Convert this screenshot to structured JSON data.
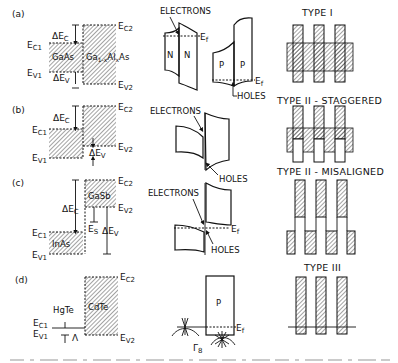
{
  "figure": {
    "panels": [
      {
        "id": "a",
        "label": "(a)",
        "left_material": "GaAs",
        "right_material": "Ga1-xAlxAs",
        "right_material_parts": [
          "Ga",
          "1-x",
          "Al",
          "x",
          "As"
        ],
        "energy_labels": {
          "ec1": "E",
          "ec1_sub": "C1",
          "ev1": "E",
          "ev1_sub": "V1",
          "ec2": "E",
          "ec2_sub": "C2",
          "ev2": "E",
          "ev2_sub": "V2"
        },
        "offsets": {
          "dec": "ΔE",
          "dec_sub": "C",
          "dev": "ΔE",
          "dev_sub": "V"
        },
        "band_diagram": {
          "n_label_left": "N",
          "n_label_right": "N",
          "p_label_left": "P",
          "p_label_right": "P",
          "electrons": "ELECTRONS",
          "holes": "HOLES",
          "fermi": "E",
          "fermi_sub": "f"
        },
        "type_label": "TYPE I"
      },
      {
        "id": "b",
        "label": "(b)",
        "energy_labels": {
          "ec1": "E",
          "ec1_sub": "C1",
          "ev1": "E",
          "ev1_sub": "V1",
          "ec2": "E",
          "ec2_sub": "C2",
          "ev2": "E",
          "ev2_sub": "V2"
        },
        "offsets": {
          "dec": "ΔE",
          "dec_sub": "C",
          "dev": "ΔE",
          "dev_sub": "V"
        },
        "band_diagram": {
          "electrons": "ELECTRONS",
          "holes": "HOLES"
        },
        "type_label": "TYPE II - STAGGERED"
      },
      {
        "id": "c",
        "label": "(c)",
        "left_material": "InAs",
        "right_material": "GaSb",
        "energy_labels": {
          "ec1": "E",
          "ec1_sub": "C1",
          "ev1": "E",
          "ev1_sub": "V1",
          "ec2": "E",
          "ec2_sub": "C2",
          "ev2": "E",
          "ev2_sub": "V2"
        },
        "offsets": {
          "dec": "ΔE",
          "dec_sub": "C",
          "dev": "ΔE",
          "dev_sub": "V",
          "es": "E",
          "es_sub": "S"
        },
        "band_diagram": {
          "electrons": "ELECTRONS",
          "holes": "HOLES",
          "fermi": "E",
          "fermi_sub": "f"
        },
        "type_label": "TYPE II - MISALIGNED"
      },
      {
        "id": "d",
        "label": "(d)",
        "left_material": "HgTe",
        "right_material": "CdTe",
        "energy_labels": {
          "ec1": "E",
          "ec1_sub": "C1",
          "ev1": "E",
          "ev1_sub": "V1",
          "ec2": "E",
          "ec2_sub": "C2",
          "ev2": "E",
          "ev2_sub": "V2"
        },
        "offsets": {
          "lambda": "Λ"
        },
        "band_diagram": {
          "p_label": "P",
          "fermi": "E",
          "fermi_sub": "f",
          "gamma": "Γ",
          "gamma_sub": "8"
        },
        "type_label": "TYPE III"
      }
    ],
    "colors": {
      "ink": "#111111",
      "background": "#ffffff",
      "hatch": "#222222"
    }
  }
}
